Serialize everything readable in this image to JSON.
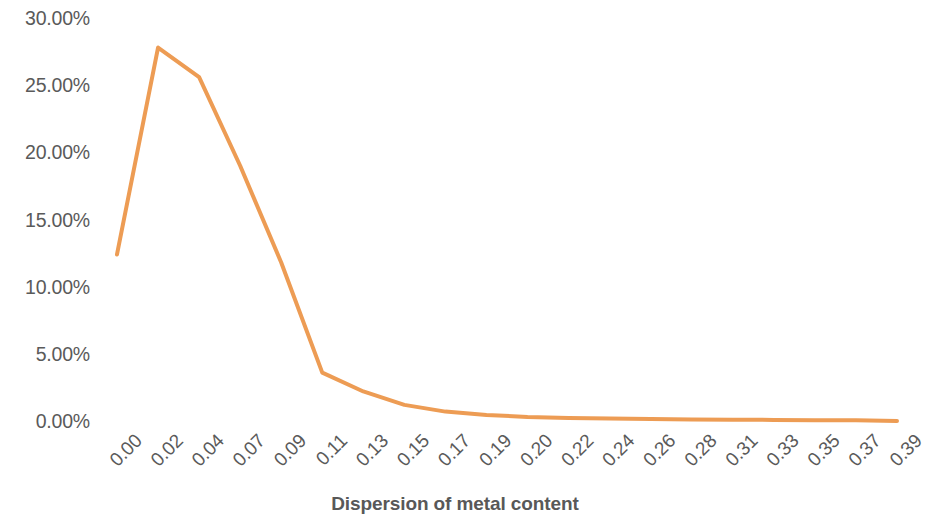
{
  "chart_data": {
    "type": "line",
    "title": "",
    "xlabel": "Dispersion of metal content",
    "ylabel": "",
    "categories": [
      "0.00",
      "0.02",
      "0.04",
      "0.07",
      "0.09",
      "0.11",
      "0.13",
      "0.15",
      "0.17",
      "0.19",
      "0.20",
      "0.22",
      "0.24",
      "0.26",
      "0.28",
      "0.31",
      "0.33",
      "0.35",
      "0.37",
      "0.39"
    ],
    "values": [
      12.4,
      27.8,
      25.6,
      19.0,
      11.8,
      3.6,
      2.2,
      1.2,
      0.7,
      0.45,
      0.3,
      0.22,
      0.18,
      0.14,
      0.12,
      0.1,
      0.08,
      0.06,
      0.05,
      0.0
    ],
    "value_suffix": "%",
    "ylim": [
      0,
      30
    ],
    "ytick_labels": [
      "30.00%",
      "25.00%",
      "20.00%",
      "15.00%",
      "10.00%",
      "5.00%",
      "0.00%"
    ],
    "ytick_values": [
      30,
      25,
      20,
      15,
      10,
      5,
      0
    ],
    "grid": false,
    "legend": false,
    "series": [
      {
        "name": "Dispersion of metal content",
        "color": "#ED9C54",
        "values": [
          12.4,
          27.8,
          25.6,
          19.0,
          11.8,
          3.6,
          2.2,
          1.2,
          0.7,
          0.45,
          0.3,
          0.22,
          0.18,
          0.14,
          0.12,
          0.1,
          0.08,
          0.06,
          0.05,
          0.0
        ]
      }
    ]
  },
  "style": {
    "line_color": "#ED9C54",
    "tick_label_color": "#5a5a5a",
    "axis_title_color": "#585858",
    "background": "#ffffff"
  }
}
